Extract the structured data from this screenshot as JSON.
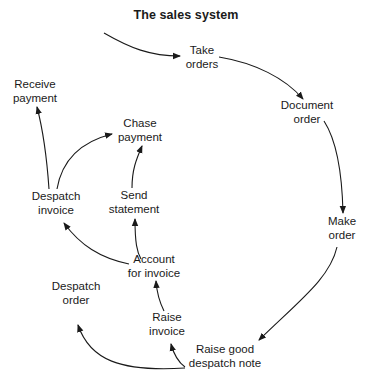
{
  "title": "The sales system",
  "nodes": {
    "take_orders": {
      "line1": "Take",
      "line2": "orders"
    },
    "document_order": {
      "line1": "Document",
      "line2": "order"
    },
    "make_order": {
      "line1": "Make",
      "line2": "order"
    },
    "raise_good_despatch_note": {
      "line1": "Raise good",
      "line2": "despatch note"
    },
    "raise_invoice": {
      "line1": "Raise",
      "line2": "invoice"
    },
    "account_for_invoice": {
      "line1": "Account",
      "line2": "for invoice"
    },
    "send_statement": {
      "line1": "Send",
      "line2": "statement"
    },
    "chase_payment": {
      "line1": "Chase",
      "line2": "payment"
    },
    "despatch_invoice": {
      "line1": "Despatch",
      "line2": "invoice"
    },
    "receive_payment": {
      "line1": "Receive",
      "line2": "payment"
    },
    "despatch_order": {
      "line1": "Despatch",
      "line2": "order"
    }
  },
  "edges": [
    {
      "from": "start",
      "to": "take_orders"
    },
    {
      "from": "take_orders",
      "to": "document_order"
    },
    {
      "from": "document_order",
      "to": "make_order"
    },
    {
      "from": "make_order",
      "to": "raise_good_despatch_note"
    },
    {
      "from": "raise_good_despatch_note",
      "to": "raise_invoice"
    },
    {
      "from": "raise_good_despatch_note",
      "to": "despatch_order"
    },
    {
      "from": "raise_invoice",
      "to": "account_for_invoice"
    },
    {
      "from": "account_for_invoice",
      "to": "send_statement"
    },
    {
      "from": "account_for_invoice",
      "to": "despatch_invoice"
    },
    {
      "from": "send_statement",
      "to": "chase_payment"
    },
    {
      "from": "despatch_invoice",
      "to": "chase_payment"
    },
    {
      "from": "despatch_invoice",
      "to": "receive_payment"
    }
  ]
}
